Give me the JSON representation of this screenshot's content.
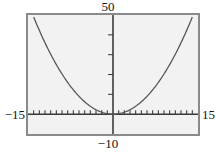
{
  "figure": {
    "kind": "graphing-calculator-plot",
    "background_color": "#ffffff",
    "plot_background_color": "#f2f2f2",
    "frame_color": "#8a8a8a",
    "axis_color": "#3a3a3a",
    "curve_color": "#555555"
  },
  "labels": {
    "ymax": "50",
    "ymin": "−10",
    "xmin": "−15",
    "xmax": "15"
  },
  "chart_data": {
    "type": "line",
    "title": "",
    "xlabel": "",
    "ylabel": "",
    "xlim": [
      -15,
      15
    ],
    "ylim": [
      -10,
      50
    ],
    "grid": false,
    "legend": "none",
    "xticks": [
      -14,
      -13,
      -12,
      -11,
      -10,
      -9,
      -8,
      -7,
      -6,
      -5,
      -4,
      -3,
      -2,
      -1,
      1,
      2,
      3,
      4,
      5,
      6,
      7,
      8,
      9,
      10,
      11,
      12,
      13,
      14
    ],
    "yticks": [
      10,
      20,
      30,
      40
    ],
    "tick_labels_shown": false,
    "axis_window_labels": {
      "top": "50",
      "bottom": "−10",
      "left": "−15",
      "right": "15"
    },
    "series": [
      {
        "name": "parabola",
        "shape": "upward parabola, vertex on x-axis at x = 0",
        "x": [
          -15,
          -14,
          -13,
          -12,
          -11,
          -10,
          -9,
          -8,
          -7,
          -6,
          -5,
          -4,
          -3,
          -2,
          -1,
          0,
          1,
          2,
          3,
          4,
          5,
          6,
          7,
          8,
          9,
          10,
          11,
          12,
          13,
          14,
          15
        ],
        "values": [
          56.25,
          49.0,
          42.25,
          36.0,
          30.25,
          25.0,
          20.25,
          16.0,
          12.25,
          9.0,
          6.25,
          4.0,
          2.25,
          1.0,
          0.25,
          0.0,
          0.25,
          1.0,
          2.25,
          4.0,
          6.25,
          9.0,
          12.25,
          16.0,
          20.25,
          25.0,
          30.25,
          36.0,
          42.25,
          49.0,
          56.25
        ]
      }
    ]
  }
}
